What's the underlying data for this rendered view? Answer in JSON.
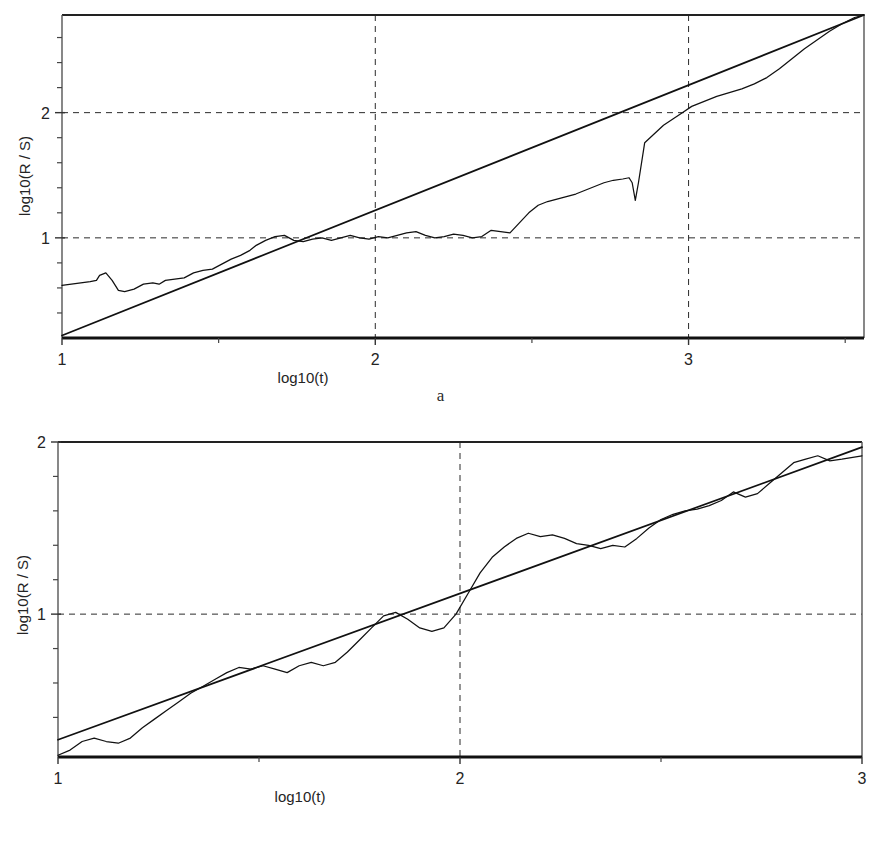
{
  "figure": {
    "panels": [
      {
        "id": "a",
        "caption": "a",
        "xlabel": "log10(t)",
        "ylabel": "log10(R / S)",
        "x_ticks": [
          "1",
          "2",
          "3"
        ],
        "y_ticks": [
          "1",
          "2"
        ]
      },
      {
        "id": "b",
        "caption": "b",
        "xlabel": "log10(t)",
        "ylabel": "log10(R / S)",
        "x_ticks": [
          "1",
          "2",
          "3"
        ],
        "y_ticks": [
          "1",
          "2"
        ]
      }
    ]
  },
  "chart_data": [
    {
      "type": "line",
      "panel": "a",
      "title": "",
      "xlabel": "log10(t)",
      "ylabel": "log10(R / S)",
      "xlim": [
        1.0,
        3.56
      ],
      "ylim": [
        0.2,
        2.78
      ],
      "xticks": [
        1,
        2,
        3
      ],
      "xticklabels": [
        "1",
        "2",
        "3"
      ],
      "yticks": [
        1,
        2
      ],
      "yticklabels": [
        "1",
        "2"
      ],
      "minor_xticks": [
        1.5,
        2.5,
        3.5
      ],
      "minor_yticks": [
        0.4,
        0.6,
        0.8,
        1.2,
        1.4,
        1.6,
        1.8,
        2.2,
        2.4,
        2.6
      ],
      "grid": "dashed gridlines at x=2, x=3, y=1, y=2",
      "legend": "none",
      "series": [
        {
          "name": "empirical R/S",
          "style": "thin wiggly line",
          "x": [
            1.0,
            1.03,
            1.06,
            1.09,
            1.11,
            1.12,
            1.14,
            1.16,
            1.18,
            1.2,
            1.23,
            1.26,
            1.29,
            1.31,
            1.33,
            1.36,
            1.39,
            1.42,
            1.45,
            1.48,
            1.51,
            1.54,
            1.57,
            1.6,
            1.62,
            1.65,
            1.68,
            1.71,
            1.74,
            1.77,
            1.8,
            1.83,
            1.86,
            1.89,
            1.92,
            1.95,
            1.98,
            2.01,
            2.04,
            2.07,
            2.1,
            2.13,
            2.16,
            2.19,
            2.22,
            2.25,
            2.28,
            2.31,
            2.34,
            2.37,
            2.4,
            2.43,
            2.46,
            2.49,
            2.52,
            2.55,
            2.58,
            2.61,
            2.64,
            2.67,
            2.7,
            2.73,
            2.76,
            2.79,
            2.81,
            2.82,
            2.83,
            2.84,
            2.86,
            2.89,
            2.92,
            2.95,
            2.98,
            3.01,
            3.05,
            3.09,
            3.13,
            3.17,
            3.21,
            3.25,
            3.29,
            3.33,
            3.37,
            3.41,
            3.45,
            3.49,
            3.53,
            3.56
          ],
          "y": [
            0.62,
            0.63,
            0.64,
            0.65,
            0.66,
            0.7,
            0.72,
            0.66,
            0.58,
            0.57,
            0.59,
            0.63,
            0.64,
            0.63,
            0.66,
            0.67,
            0.68,
            0.72,
            0.74,
            0.75,
            0.79,
            0.83,
            0.86,
            0.9,
            0.94,
            0.98,
            1.01,
            1.02,
            0.98,
            0.97,
            0.99,
            1.0,
            0.98,
            1.0,
            1.02,
            1.0,
            0.99,
            1.01,
            1.0,
            1.02,
            1.04,
            1.05,
            1.02,
            1.0,
            1.01,
            1.03,
            1.02,
            1.0,
            1.01,
            1.06,
            1.05,
            1.04,
            1.12,
            1.2,
            1.26,
            1.29,
            1.31,
            1.33,
            1.35,
            1.38,
            1.41,
            1.44,
            1.46,
            1.47,
            1.48,
            1.44,
            1.3,
            1.44,
            1.76,
            1.83,
            1.9,
            1.95,
            2.0,
            2.05,
            2.09,
            2.13,
            2.16,
            2.19,
            2.23,
            2.28,
            2.35,
            2.43,
            2.51,
            2.58,
            2.65,
            2.71,
            2.76,
            2.78
          ]
        },
        {
          "name": "fitted regression line",
          "style": "straight solid line",
          "x": [
            1.0,
            3.56
          ],
          "y": [
            0.22,
            2.78
          ],
          "slope_hurst_estimate": 1.0
        }
      ]
    },
    {
      "type": "line",
      "panel": "b",
      "title": "",
      "xlabel": "log10(t)",
      "ylabel": "log10(R / S)",
      "xlim": [
        1.0,
        3.0
      ],
      "ylim": [
        0.17,
        2.0
      ],
      "xticks": [
        1,
        2,
        3
      ],
      "xticklabels": [
        "1",
        "2",
        "3"
      ],
      "yticks": [
        1,
        2
      ],
      "yticklabels": [
        "1",
        "2"
      ],
      "minor_xticks": [
        1.5,
        2.5
      ],
      "minor_yticks": [
        0.4,
        0.6,
        0.8,
        1.2,
        1.4,
        1.6,
        1.8
      ],
      "grid": "dashed gridlines at x=2, y=1, y=2 (y=2 coincides with top frame)",
      "legend": "none",
      "series": [
        {
          "name": "empirical R/S",
          "style": "thin wiggly line",
          "x": [
            1.0,
            1.03,
            1.06,
            1.09,
            1.12,
            1.15,
            1.18,
            1.21,
            1.24,
            1.27,
            1.3,
            1.33,
            1.36,
            1.39,
            1.42,
            1.45,
            1.48,
            1.51,
            1.54,
            1.57,
            1.6,
            1.63,
            1.66,
            1.69,
            1.72,
            1.75,
            1.78,
            1.81,
            1.84,
            1.87,
            1.9,
            1.93,
            1.96,
            1.99,
            2.02,
            2.05,
            2.08,
            2.11,
            2.14,
            2.17,
            2.2,
            2.23,
            2.26,
            2.29,
            2.32,
            2.35,
            2.38,
            2.41,
            2.44,
            2.47,
            2.5,
            2.53,
            2.56,
            2.59,
            2.62,
            2.65,
            2.68,
            2.71,
            2.74,
            2.77,
            2.8,
            2.83,
            2.86,
            2.89,
            2.92,
            2.95,
            3.0
          ],
          "y": [
            0.18,
            0.21,
            0.26,
            0.28,
            0.26,
            0.25,
            0.28,
            0.34,
            0.39,
            0.44,
            0.49,
            0.54,
            0.58,
            0.62,
            0.66,
            0.69,
            0.68,
            0.7,
            0.68,
            0.66,
            0.7,
            0.72,
            0.7,
            0.72,
            0.78,
            0.85,
            0.92,
            0.99,
            1.01,
            0.97,
            0.92,
            0.9,
            0.92,
            1.0,
            1.12,
            1.24,
            1.33,
            1.39,
            1.44,
            1.47,
            1.45,
            1.46,
            1.44,
            1.41,
            1.4,
            1.38,
            1.4,
            1.39,
            1.44,
            1.5,
            1.55,
            1.58,
            1.6,
            1.61,
            1.63,
            1.66,
            1.71,
            1.68,
            1.7,
            1.76,
            1.82,
            1.88,
            1.9,
            1.92,
            1.89,
            1.9,
            1.92
          ],
          "note": "curve truncated/flattens near x=3 at about y=1.92"
        },
        {
          "name": "fitted regression line",
          "style": "straight solid line",
          "x": [
            1.0,
            3.0
          ],
          "y": [
            0.27,
            1.97
          ],
          "slope_hurst_estimate": 0.85
        }
      ]
    }
  ]
}
